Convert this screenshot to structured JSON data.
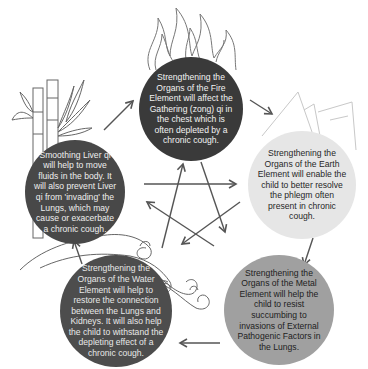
{
  "diagram": {
    "type": "five-element-cycle",
    "nodes": [
      {
        "id": "fire",
        "element": "Fire",
        "icon": "flame-icon",
        "text": "Strengthening the Organs of the Fire Element will affect the Gathering (zong) qi in the chest which is often depleted by a chronic cough.",
        "fill": "#3a3a3a"
      },
      {
        "id": "earth",
        "element": "Earth",
        "icon": "mountain-icon",
        "text": "Strengthening the Organs of the Earth Element will enable the child to better resolve the phlegm often present in chronic cough.",
        "fill": "#e6e6e6"
      },
      {
        "id": "metal",
        "element": "Metal",
        "icon": "crystal-icon",
        "text": "Strengthening the Organs of the Metal Element will help the child to resist succumbing to invasions of External Pathogenic Factors in the Lungs.",
        "fill": "#a0a0a0"
      },
      {
        "id": "water",
        "element": "Water",
        "icon": "wave-icon",
        "text": "Strengthening the Organs of the Water Element will help to restore the connection between the Lungs and Kidneys. It will also help the child to withstand the depleting effect of a chronic cough.",
        "fill": "#4d4d4d"
      },
      {
        "id": "wood",
        "element": "Wood",
        "icon": "bamboo-icon",
        "text": "Smoothing Liver qi will help to move fluids in the body. It will also prevent Liver qi from 'invading' the Lungs, which may cause or exacerbate a chronic cough.",
        "fill": "#484848"
      }
    ],
    "cycle_arrows": [
      {
        "from": "wood",
        "to": "fire"
      },
      {
        "from": "fire",
        "to": "earth"
      },
      {
        "from": "earth",
        "to": "metal"
      },
      {
        "from": "metal",
        "to": "water"
      },
      {
        "from": "water",
        "to": "wood"
      }
    ],
    "star_arrows": [
      {
        "from": "wood",
        "to": "earth"
      },
      {
        "from": "earth",
        "to": "water"
      },
      {
        "from": "water",
        "to": "fire"
      },
      {
        "from": "fire",
        "to": "metal"
      },
      {
        "from": "metal",
        "to": "wood"
      }
    ],
    "arrow_color": "#555555"
  }
}
